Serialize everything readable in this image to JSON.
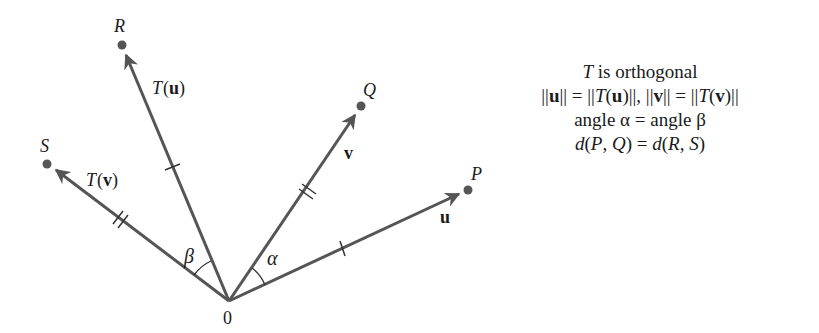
{
  "diagram": {
    "type": "orthogonal-transformation-vectors",
    "origin": {
      "label": "0",
      "x": 229,
      "y": 301
    },
    "colors": {
      "vector": "#555555",
      "point": "#555555",
      "text": "#1a1a1a"
    },
    "points": [
      {
        "id": "P",
        "label": "P",
        "x": 468,
        "y": 190
      },
      {
        "id": "Q",
        "label": "Q",
        "x": 361,
        "y": 106
      },
      {
        "id": "R",
        "label": "R",
        "x": 122,
        "y": 45
      },
      {
        "id": "S",
        "label": "S",
        "x": 47,
        "y": 164
      }
    ],
    "vectors": [
      {
        "id": "u",
        "label": "u",
        "to": "P",
        "tick_marks": 1
      },
      {
        "id": "v",
        "label": "v",
        "to": "Q",
        "tick_marks": 2
      },
      {
        "id": "Tu",
        "label_prefix": "T(",
        "label_bold": "u",
        "label_suffix": ")",
        "to": "R",
        "tick_marks": 1
      },
      {
        "id": "Tv",
        "label_prefix": "T(",
        "label_bold": "v",
        "label_suffix": ")",
        "to": "S",
        "tick_marks": 2
      }
    ],
    "angles": [
      {
        "label": "α",
        "between": [
          "u",
          "v"
        ]
      },
      {
        "label": "β",
        "between": [
          "Tu",
          "Tv"
        ]
      }
    ]
  },
  "caption": {
    "line1_T": "T",
    "line1_rest": " is orthogonal",
    "line2": "||u|| = ||T(u)||, ||v|| = ||T(v)||",
    "line3": "angle α = angle β",
    "line4": "d(P, Q) = d(R, S)"
  }
}
